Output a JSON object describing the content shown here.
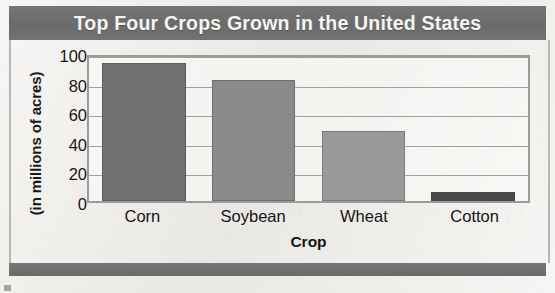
{
  "chart_data": {
    "type": "bar",
    "title": "Top Four Crops Grown in the United States",
    "xlabel": "Crop",
    "ylabel": "(in millions of acres)",
    "categories": [
      "Corn",
      "Soybean",
      "Wheat",
      "Cotton"
    ],
    "values": [
      93,
      82,
      47,
      6
    ],
    "series": [
      {
        "name": "Acres planted",
        "values": [
          93,
          82,
          47,
          6
        ]
      }
    ],
    "ylim": [
      0,
      100
    ],
    "yticks": [
      0,
      20,
      40,
      60,
      80,
      100
    ],
    "ytick_labels": [
      "0",
      "20",
      "40",
      "60",
      "80",
      "100"
    ],
    "grid": true,
    "grid_axis": "y",
    "legend": false,
    "legend_position": "none",
    "bar_colors": [
      "#707070",
      "#8a8a8a",
      "#9a9a9a",
      "#4a4a4a"
    ]
  },
  "header": {
    "title": "Top Four Crops Grown in the United States",
    "background_color": "#6f6f6f",
    "text_color": "#f6f5f2"
  },
  "axes": {
    "y_title": "(in millions of acres)",
    "x_title": "Crop",
    "y_tick_labels": [
      "100",
      "80",
      "60",
      "40",
      "20",
      "0"
    ],
    "x_tick_labels": [
      "Corn",
      "Soybean",
      "Wheat",
      "Cotton"
    ]
  },
  "footer": {
    "background_color": "#6f6f6f"
  },
  "page": {
    "background_color": "#edebe7"
  }
}
